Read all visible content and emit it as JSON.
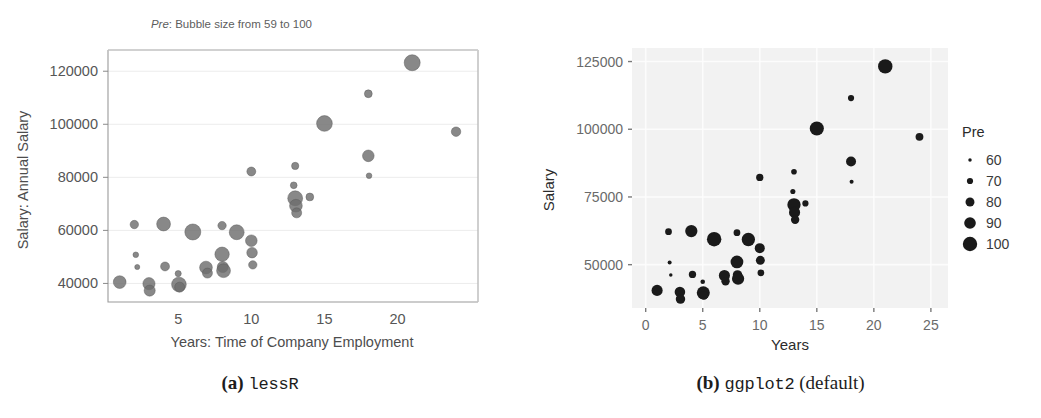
{
  "figure": {
    "width": 1041,
    "height": 418,
    "background": "#ffffff"
  },
  "panel_a": {
    "caption_label": "(a)",
    "caption_name": "lessR",
    "subtitle_emphasis": "Pre",
    "subtitle_rest": ": Bubble size from 59 to 100",
    "point_color": "#6e6e6e",
    "point_stroke": "#5a5a5a",
    "axis_color": "#8a8a8a",
    "grid_color": "#ececec",
    "panel_bg": "#ffffff",
    "chart_data": {
      "type": "scatter",
      "title": "Pre: Bubble size from 59 to 100",
      "xlabel": "Years: Time of Company Employment",
      "ylabel": "Salary: Annual Salary",
      "xlim": [
        0.2,
        25.5
      ],
      "ylim": [
        33000,
        128000
      ],
      "xticks": [
        5,
        10,
        15,
        20
      ],
      "yticks": [
        40000,
        60000,
        80000,
        100000,
        120000
      ],
      "xticklabels": [
        "5",
        "10",
        "15",
        "20"
      ],
      "yticklabels": [
        "40000",
        "60000",
        "80000",
        "100000",
        "120000"
      ],
      "grid": true,
      "size_legend_label": "Pre",
      "size_range": [
        59,
        100
      ],
      "size_px_range": [
        2.4,
        8.0
      ],
      "points": [
        {
          "x": 1.0,
          "y": 40500,
          "size": 88
        },
        {
          "x": 2.0,
          "y": 62200,
          "size": 72
        },
        {
          "x": 2.1,
          "y": 50800,
          "size": 62
        },
        {
          "x": 2.2,
          "y": 46200,
          "size": 60
        },
        {
          "x": 3.0,
          "y": 39900,
          "size": 86
        },
        {
          "x": 3.05,
          "y": 37300,
          "size": 82
        },
        {
          "x": 4.0,
          "y": 62400,
          "size": 92
        },
        {
          "x": 4.1,
          "y": 46400,
          "size": 74
        },
        {
          "x": 5.0,
          "y": 43700,
          "size": 64
        },
        {
          "x": 5.05,
          "y": 39600,
          "size": 95
        },
        {
          "x": 5.1,
          "y": 38600,
          "size": 78
        },
        {
          "x": 6.0,
          "y": 59400,
          "size": 100
        },
        {
          "x": 6.9,
          "y": 46000,
          "size": 88
        },
        {
          "x": 7.0,
          "y": 43900,
          "size": 78
        },
        {
          "x": 8.0,
          "y": 61800,
          "size": 72
        },
        {
          "x": 8.0,
          "y": 51000,
          "size": 94
        },
        {
          "x": 8.05,
          "y": 46200,
          "size": 82
        },
        {
          "x": 8.1,
          "y": 44800,
          "size": 92
        },
        {
          "x": 9.0,
          "y": 59300,
          "size": 96
        },
        {
          "x": 10.0,
          "y": 82200,
          "size": 74
        },
        {
          "x": 10.0,
          "y": 56100,
          "size": 84
        },
        {
          "x": 10.05,
          "y": 51600,
          "size": 80
        },
        {
          "x": 10.1,
          "y": 47000,
          "size": 72
        },
        {
          "x": 12.9,
          "y": 77000,
          "size": 66
        },
        {
          "x": 13.0,
          "y": 72100,
          "size": 96
        },
        {
          "x": 13.05,
          "y": 69300,
          "size": 88
        },
        {
          "x": 13.1,
          "y": 66600,
          "size": 78
        },
        {
          "x": 13.0,
          "y": 84300,
          "size": 68
        },
        {
          "x": 14.0,
          "y": 72600,
          "size": 70
        },
        {
          "x": 15.0,
          "y": 100300,
          "size": 99
        },
        {
          "x": 18.0,
          "y": 111500,
          "size": 70
        },
        {
          "x": 18.0,
          "y": 88100,
          "size": 84
        },
        {
          "x": 18.05,
          "y": 80600,
          "size": 62
        },
        {
          "x": 21.0,
          "y": 123200,
          "size": 100
        },
        {
          "x": 24.0,
          "y": 97200,
          "size": 76
        }
      ]
    }
  },
  "panel_b": {
    "caption_label": "(b)",
    "caption_name": "ggplot2",
    "caption_suffix": "(default)",
    "point_color": "#1a1a1a",
    "panel_bg": "#f2f2f2",
    "grid_color": "#fdfdfd",
    "tick_color": "#7a7a7a",
    "legend": {
      "title": "Pre",
      "entries": [
        {
          "label": "60",
          "size": 60
        },
        {
          "label": "70",
          "size": 70
        },
        {
          "label": "80",
          "size": 80
        },
        {
          "label": "90",
          "size": 90
        },
        {
          "label": "100",
          "size": 100
        }
      ]
    },
    "chart_data": {
      "type": "scatter",
      "title": "",
      "xlabel": "Years",
      "ylabel": "Salary",
      "xlim": [
        -1.2,
        26.5
      ],
      "ylim": [
        34000,
        130000
      ],
      "xticks": [
        0,
        5,
        10,
        15,
        20,
        25
      ],
      "yticks": [
        50000,
        75000,
        100000,
        125000
      ],
      "xticklabels": [
        "0",
        "5",
        "10",
        "15",
        "20",
        "25"
      ],
      "yticklabels": [
        "50000",
        "75000",
        "100000",
        "125000"
      ],
      "grid": true,
      "legend_position": "right",
      "size_legend_label": "Pre",
      "size_range": [
        59,
        100
      ],
      "size_px_range": [
        1.6,
        7.2
      ],
      "points": [
        {
          "x": 1.0,
          "y": 40500,
          "size": 88
        },
        {
          "x": 2.0,
          "y": 62200,
          "size": 72
        },
        {
          "x": 2.1,
          "y": 50800,
          "size": 62
        },
        {
          "x": 2.2,
          "y": 46200,
          "size": 60
        },
        {
          "x": 3.0,
          "y": 39900,
          "size": 86
        },
        {
          "x": 3.05,
          "y": 37300,
          "size": 82
        },
        {
          "x": 4.0,
          "y": 62400,
          "size": 92
        },
        {
          "x": 4.1,
          "y": 46400,
          "size": 74
        },
        {
          "x": 5.0,
          "y": 43700,
          "size": 64
        },
        {
          "x": 5.05,
          "y": 39600,
          "size": 95
        },
        {
          "x": 5.1,
          "y": 38600,
          "size": 78
        },
        {
          "x": 6.0,
          "y": 59400,
          "size": 100
        },
        {
          "x": 6.9,
          "y": 46000,
          "size": 88
        },
        {
          "x": 7.0,
          "y": 43900,
          "size": 78
        },
        {
          "x": 8.0,
          "y": 61800,
          "size": 72
        },
        {
          "x": 8.0,
          "y": 51000,
          "size": 94
        },
        {
          "x": 8.05,
          "y": 46200,
          "size": 82
        },
        {
          "x": 8.1,
          "y": 44800,
          "size": 92
        },
        {
          "x": 9.0,
          "y": 59300,
          "size": 96
        },
        {
          "x": 10.0,
          "y": 82200,
          "size": 74
        },
        {
          "x": 10.0,
          "y": 56100,
          "size": 84
        },
        {
          "x": 10.05,
          "y": 51600,
          "size": 80
        },
        {
          "x": 10.1,
          "y": 47000,
          "size": 72
        },
        {
          "x": 12.9,
          "y": 77000,
          "size": 66
        },
        {
          "x": 13.0,
          "y": 72100,
          "size": 96
        },
        {
          "x": 13.05,
          "y": 69300,
          "size": 88
        },
        {
          "x": 13.1,
          "y": 66600,
          "size": 78
        },
        {
          "x": 13.0,
          "y": 84300,
          "size": 68
        },
        {
          "x": 14.0,
          "y": 72600,
          "size": 70
        },
        {
          "x": 15.0,
          "y": 100300,
          "size": 99
        },
        {
          "x": 18.0,
          "y": 111500,
          "size": 70
        },
        {
          "x": 18.0,
          "y": 88100,
          "size": 84
        },
        {
          "x": 18.05,
          "y": 80600,
          "size": 62
        },
        {
          "x": 21.0,
          "y": 123200,
          "size": 100
        },
        {
          "x": 24.0,
          "y": 97200,
          "size": 76
        }
      ]
    }
  }
}
